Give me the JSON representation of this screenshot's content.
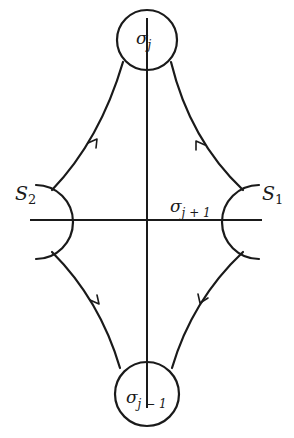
{
  "diagram": {
    "labels": {
      "top_circle": {
        "base": "σ",
        "sub": "j"
      },
      "bottom_circle": {
        "base": "σ",
        "sub": "j − 1"
      },
      "center_right": {
        "base": "σ",
        "sub": "j + 1"
      },
      "left_arc": {
        "base": "S",
        "sub": "2"
      },
      "right_arc": {
        "base": "S",
        "sub": "1"
      }
    },
    "nodes": [
      {
        "id": "sigma_j",
        "shape": "circle",
        "cx": 147,
        "cy": 40,
        "r": 30
      },
      {
        "id": "sigma_j_minus_1",
        "shape": "circle",
        "cx": 147,
        "cy": 393,
        "r": 32
      },
      {
        "id": "S2",
        "shape": "arc",
        "side": "left"
      },
      {
        "id": "S1",
        "shape": "arc",
        "side": "right"
      }
    ],
    "edges": [
      {
        "from": "S2",
        "to": "sigma_j",
        "direction": "up-right"
      },
      {
        "from": "S1",
        "to": "sigma_j",
        "direction": "up-left"
      },
      {
        "from": "S2",
        "to": "sigma_j_minus_1",
        "direction": "down-right"
      },
      {
        "from": "S1",
        "to": "sigma_j_minus_1",
        "direction": "down-left"
      }
    ],
    "colors": {
      "ink": "#1a1a1a",
      "background": "#ffffff"
    }
  }
}
